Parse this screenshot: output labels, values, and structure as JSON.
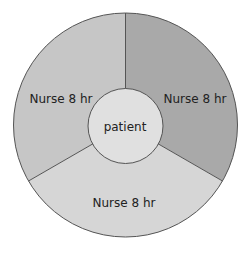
{
  "diagram": {
    "center_label": "patient",
    "segments": [
      {
        "label": "Nurse 8 hr",
        "position": "upper-left",
        "color": "#c6c6c6"
      },
      {
        "label": "Nurse 8 hr",
        "position": "right",
        "color": "#a9a9a9"
      },
      {
        "label": "Nurse 8 hr",
        "position": "bottom",
        "color": "#d6d6d6"
      }
    ],
    "center_color": "#e0e0e0",
    "stroke_color": "#555555"
  }
}
